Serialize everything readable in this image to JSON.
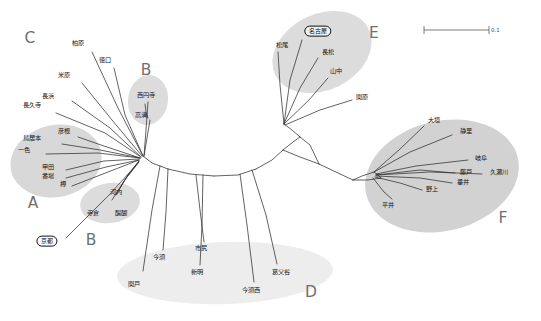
{
  "figure": {
    "type": "phylogenetic-network",
    "background": "#ffffff",
    "edge_color": "#2a2a2a",
    "cluster_fill": "#d7d7d7",
    "cluster_fill_light": "#e6e6e6",
    "letter_color": "#6f6f6f"
  },
  "scale_bar": {
    "label": "0.1",
    "x1": 424,
    "x2": 489,
    "y": 30
  },
  "clusters": [
    {
      "letter": "C",
      "x": 30,
      "y": 38,
      "fill": "none"
    },
    {
      "letter": "B",
      "x": 146,
      "y": 70,
      "fill": "#d9d9d9"
    },
    {
      "letter": "A",
      "x": 33,
      "y": 203,
      "fill": "#d7d7d7"
    },
    {
      "letter": "B",
      "x": 91,
      "y": 240,
      "fill": "#d9d9d9"
    },
    {
      "letter": "D",
      "x": 311,
      "y": 292,
      "fill": "#e8e8e8"
    },
    {
      "letter": "E",
      "x": 374,
      "y": 33,
      "fill": "#d9d9d9"
    },
    {
      "letter": "F",
      "x": 503,
      "y": 218,
      "fill": "#cfcfcf"
    }
  ],
  "ellipses": [
    {
      "name": "cluster-b-top-ellipse",
      "cx": 148,
      "cy": 99,
      "rx": 20,
      "ry": 24,
      "rot": 8,
      "fill": "#d9d9d9"
    },
    {
      "name": "cluster-a-ellipse",
      "cx": 55,
      "cy": 160,
      "rx": 45,
      "ry": 35,
      "rot": -10,
      "fill": "#d7d7d7"
    },
    {
      "name": "cluster-b-bottom-ellipse",
      "cx": 108,
      "cy": 203,
      "rx": 29,
      "ry": 19,
      "rot": -8,
      "fill": "#d9d9d9"
    },
    {
      "name": "cluster-d-ellipse",
      "cx": 225,
      "cy": 273,
      "rx": 108,
      "ry": 31,
      "rot": -2,
      "fill": "#e8e8e8"
    },
    {
      "name": "cluster-e-ellipse",
      "cx": 322,
      "cy": 52,
      "rx": 52,
      "ry": 37,
      "rot": -24,
      "fill": "#d9d9d9"
    },
    {
      "name": "cluster-f-ellipse",
      "cx": 440,
      "cy": 176,
      "rx": 77,
      "ry": 54,
      "rot": -12,
      "fill": "#cfcfcf"
    }
  ],
  "tips": [
    {
      "id": "kashiwabara",
      "label": "柏原",
      "x": 78,
      "y": 43,
      "circled": false,
      "anchor_x": 143,
      "anchor_y": 156
    },
    {
      "id": "tokuguchi",
      "label": "徳口",
      "x": 105,
      "y": 60,
      "circled": false,
      "anchor_x": 143,
      "anchor_y": 156
    },
    {
      "id": "maibara",
      "label": "米原",
      "x": 64,
      "y": 75,
      "circled": false,
      "anchor_x": 142,
      "anchor_y": 156
    },
    {
      "id": "nagahama",
      "label": "長浜",
      "x": 48,
      "y": 96,
      "circled": false,
      "anchor_x": 141,
      "anchor_y": 157
    },
    {
      "id": "chokyuji",
      "label": "長久寺",
      "x": 32,
      "y": 105,
      "circled": false,
      "anchor_x": 141,
      "anchor_y": 157
    },
    {
      "id": "hikone",
      "label": "彦根",
      "x": 64,
      "y": 131,
      "circled": false,
      "anchor_x": 140,
      "anchor_y": 158
    },
    {
      "id": "toriimoto",
      "label": "鳥居本",
      "x": 32,
      "y": 138,
      "circled": false,
      "anchor_x": 140,
      "anchor_y": 158
    },
    {
      "id": "isshiki",
      "label": "一色",
      "x": 24,
      "y": 150,
      "circled": false,
      "anchor_x": 140,
      "anchor_y": 158
    },
    {
      "id": "koda",
      "label": "甲田",
      "x": 48,
      "y": 167,
      "circled": false,
      "anchor_x": 139,
      "anchor_y": 160
    },
    {
      "id": "bamba",
      "label": "番場",
      "x": 48,
      "y": 176,
      "circled": false,
      "anchor_x": 139,
      "anchor_y": 160
    },
    {
      "id": "taru",
      "label": "樽",
      "x": 63,
      "y": 184,
      "circled": false,
      "anchor_x": 139,
      "anchor_y": 160
    },
    {
      "id": "saienji",
      "label": "西円寺",
      "x": 146,
      "y": 95,
      "circled": false,
      "anchor_x": 144,
      "anchor_y": 156
    },
    {
      "id": "takamizo",
      "label": "高溝",
      "x": 141,
      "y": 115,
      "circled": false,
      "anchor_x": 144,
      "anchor_y": 156
    },
    {
      "id": "kawachi",
      "label": "河内",
      "x": 116,
      "y": 192,
      "circled": false,
      "anchor_x": 139,
      "anchor_y": 162
    },
    {
      "id": "teragura",
      "label": "寺倉",
      "x": 93,
      "y": 213,
      "circled": false,
      "anchor_x": 139,
      "anchor_y": 162
    },
    {
      "id": "daigo",
      "label": "醍醐",
      "x": 121,
      "y": 213,
      "circled": false,
      "anchor_x": 139,
      "anchor_y": 162
    },
    {
      "id": "kyoto",
      "label": "京都",
      "x": 47,
      "y": 241,
      "circled": true,
      "anchor_x": 138,
      "anchor_y": 163
    },
    {
      "id": "imasu",
      "label": "今須",
      "x": 159,
      "y": 257,
      "circled": false,
      "anchor_x": 166,
      "anchor_y": 177
    },
    {
      "id": "sekigado",
      "label": "関戸",
      "x": 134,
      "y": 284,
      "circled": false,
      "anchor_x": 166,
      "anchor_y": 177
    },
    {
      "id": "ichijiri",
      "label": "市尻",
      "x": 201,
      "y": 248,
      "circled": false,
      "anchor_x": 201,
      "anchor_y": 170
    },
    {
      "id": "shinmei",
      "label": "新明",
      "x": 197,
      "y": 272,
      "circled": false,
      "anchor_x": 201,
      "anchor_y": 170
    },
    {
      "id": "kuzuchidani",
      "label": "葛父谷",
      "x": 281,
      "y": 272,
      "circled": false,
      "anchor_x": 251,
      "anchor_y": 168
    },
    {
      "id": "imasunishi",
      "label": "今須西",
      "x": 251,
      "y": 290,
      "circled": false,
      "anchor_x": 247,
      "anchor_y": 170
    },
    {
      "id": "nagoya",
      "label": "名古屋",
      "x": 318,
      "y": 31,
      "circled": true,
      "anchor_x": 284,
      "anchor_y": 123
    },
    {
      "id": "matsuo",
      "label": "松尾",
      "x": 282,
      "y": 45,
      "circled": false,
      "anchor_x": 284,
      "anchor_y": 123
    },
    {
      "id": "nagamatsu",
      "label": "長松",
      "x": 328,
      "y": 52,
      "circled": false,
      "anchor_x": 284,
      "anchor_y": 123
    },
    {
      "id": "yamanaka",
      "label": "山中",
      "x": 336,
      "y": 71,
      "circled": false,
      "anchor_x": 284,
      "anchor_y": 123
    },
    {
      "id": "sekigahara",
      "label": "関原",
      "x": 362,
      "y": 97,
      "circled": false,
      "anchor_x": 284,
      "anchor_y": 124
    },
    {
      "id": "ogaki",
      "label": "大垣",
      "x": 434,
      "y": 120,
      "circled": false,
      "anchor_x": 374,
      "anchor_y": 172
    },
    {
      "id": "shizusato",
      "label": "静里",
      "x": 466,
      "y": 131,
      "circled": false,
      "anchor_x": 374,
      "anchor_y": 172
    },
    {
      "id": "gifu",
      "label": "岐阜",
      "x": 481,
      "y": 158,
      "circled": false,
      "anchor_x": 376,
      "anchor_y": 175
    },
    {
      "id": "fujie",
      "label": "藤戸",
      "x": 466,
      "y": 172,
      "circled": false,
      "anchor_x": 376,
      "anchor_y": 176
    },
    {
      "id": "kuzeri",
      "label": "久瀬川",
      "x": 499,
      "y": 172,
      "circled": false,
      "anchor_x": 376,
      "anchor_y": 176
    },
    {
      "id": "tarui",
      "label": "垂井",
      "x": 463,
      "y": 182,
      "circled": false,
      "anchor_x": 376,
      "anchor_y": 177
    },
    {
      "id": "nogami",
      "label": "野上",
      "x": 432,
      "y": 189,
      "circled": false,
      "anchor_x": 374,
      "anchor_y": 177
    },
    {
      "id": "hirai",
      "label": "平井",
      "x": 388,
      "y": 205,
      "circled": false,
      "anchor_x": 372,
      "anchor_y": 178
    }
  ],
  "network_edges": {
    "backbone": [
      [
        143,
        156,
        168,
        168
      ],
      [
        168,
        168,
        212,
        176
      ],
      [
        212,
        176,
        252,
        170
      ],
      [
        252,
        170,
        282,
        152
      ],
      [
        282,
        152,
        300,
        138
      ],
      [
        300,
        138,
        284,
        124
      ],
      [
        282,
        152,
        318,
        164
      ],
      [
        318,
        164,
        352,
        180
      ],
      [
        352,
        180,
        380,
        178
      ],
      [
        380,
        178,
        374,
        172
      ]
    ]
  }
}
